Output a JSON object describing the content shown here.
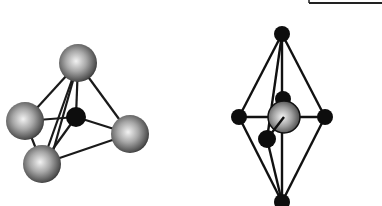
{
  "diagram": {
    "structures": [
      {
        "name": "tetrahedral",
        "central_atom": {
          "x": 76,
          "y": 117,
          "r": 10,
          "color": "#111111"
        },
        "ligands": [
          {
            "id": "top",
            "x": 78,
            "y": 63,
            "r": 19
          },
          {
            "id": "left",
            "x": 25,
            "y": 121,
            "r": 19
          },
          {
            "id": "right",
            "x": 130,
            "y": 134,
            "r": 19
          },
          {
            "id": "bottom",
            "x": 42,
            "y": 164,
            "r": 19
          }
        ],
        "ligand_color": "#8a8a8a"
      },
      {
        "name": "octahedral",
        "central_atom": {
          "x": 284,
          "y": 117,
          "r": 16,
          "color": "#9a9a9a"
        },
        "ligands": [
          {
            "id": "top",
            "x": 282,
            "y": 34,
            "r": 8
          },
          {
            "id": "left",
            "x": 239,
            "y": 117,
            "r": 8
          },
          {
            "id": "right",
            "x": 325,
            "y": 117,
            "r": 8
          },
          {
            "id": "bottom",
            "x": 282,
            "y": 202,
            "r": 8
          },
          {
            "id": "back",
            "x": 283,
            "y": 99,
            "r": 8
          },
          {
            "id": "front",
            "x": 267,
            "y": 139,
            "r": 9
          }
        ],
        "ligand_color": "#111111"
      }
    ],
    "frame_fragment": {
      "x1": 309,
      "x2": 382,
      "y": 3
    }
  }
}
